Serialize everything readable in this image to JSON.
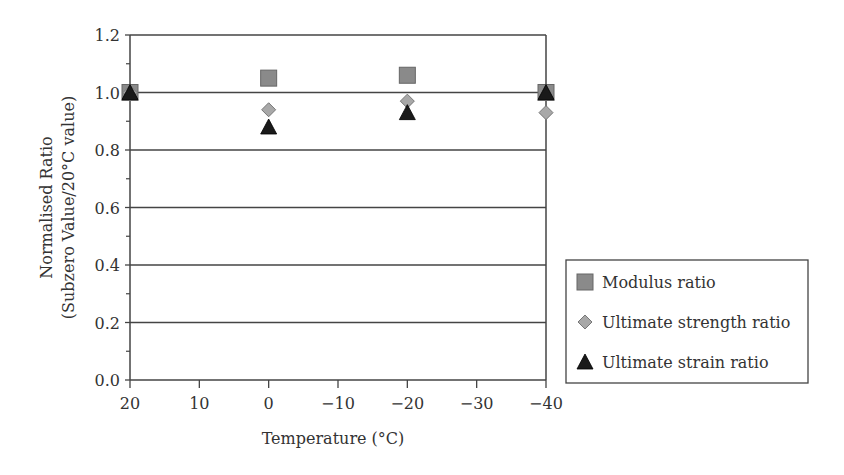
{
  "chart_data": {
    "type": "scatter",
    "title": "",
    "xlabel": "Temperature (°C)",
    "ylabel_line1": "Normalised Ratio",
    "ylabel_line2": "(Subzero Value/20°C value)",
    "x_ticks": [
      20,
      10,
      0,
      -10,
      -20,
      -30,
      -40
    ],
    "x_tick_labels": [
      "20",
      "10",
      "0",
      "−10",
      "−20",
      "−30",
      "−40"
    ],
    "y_ticks": [
      0.0,
      0.2,
      0.4,
      0.6,
      0.8,
      1.0,
      1.2
    ],
    "y_tick_labels": [
      "0.0",
      "0.2",
      "0.4",
      "0.6",
      "0.8",
      "1.0",
      "1.2"
    ],
    "xlim": [
      20,
      -40
    ],
    "ylim": [
      0,
      1.2
    ],
    "grid": "horizontal",
    "legend_position": "right",
    "x": [
      20,
      0,
      -20,
      -40
    ],
    "series": [
      {
        "name": "Modulus ratio",
        "marker": "square",
        "color": "#8a8a8a",
        "values": [
          1.0,
          1.05,
          1.06,
          1.0
        ]
      },
      {
        "name": "Ultimate strength ratio",
        "marker": "diamond",
        "color": "#a8a8a8",
        "values": [
          1.0,
          0.94,
          0.97,
          0.93
        ]
      },
      {
        "name": "Ultimate strain ratio",
        "marker": "triangle",
        "color": "#1a1a1a",
        "values": [
          1.0,
          0.88,
          0.93,
          1.0
        ]
      }
    ]
  }
}
